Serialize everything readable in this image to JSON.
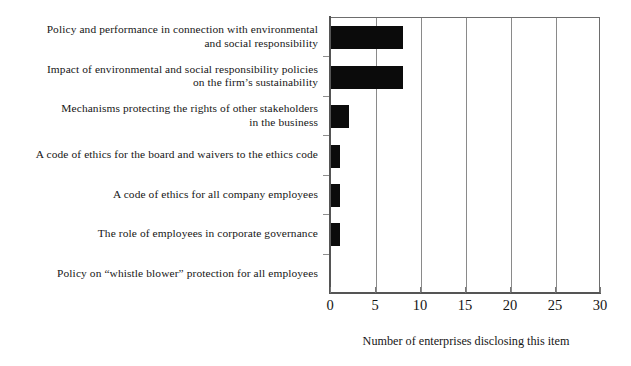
{
  "chart_data": {
    "type": "bar",
    "orientation": "horizontal",
    "title": "",
    "xlabel": "Number of enterprises disclosing this item",
    "ylabel": "",
    "xlim": [
      0,
      30
    ],
    "xticks": [
      0,
      5,
      10,
      15,
      20,
      25,
      30
    ],
    "grid": "vertical",
    "legend": "none",
    "bar_color": "#0b0b0b",
    "categories": [
      "Policy and performance in connection with environmental and social responsibility",
      "Impact of environmental and social responsibility policies on the firm’s sustainability",
      "Mechanisms protecting the rights of other stakeholders in the business",
      "A code of ethics for the board and waivers to the ethics code",
      "A code of ethics for all company employees",
      "The role of employees in corporate governance",
      "Policy on “whistle blower” protection for all employees"
    ],
    "category_lines": [
      [
        "Policy and performance in connection with environmental",
        "and social responsibility"
      ],
      [
        "Impact of environmental and social responsibility policies",
        "on the firm’s sustainability"
      ],
      [
        "Mechanisms protecting the rights of other stakeholders",
        "in the business"
      ],
      [
        "A code of ethics for the board and waivers to the ethics code"
      ],
      [
        "A code of ethics for all company employees"
      ],
      [
        "The role of employees in corporate governance"
      ],
      [
        "Policy on “whistle blower” protection for all employees"
      ]
    ],
    "values": [
      8,
      8,
      2,
      1,
      1,
      1,
      0
    ]
  },
  "axis": {
    "x_tick_labels": [
      "0",
      "5",
      "10",
      "15",
      "20",
      "25",
      "30"
    ],
    "x_title": "Number of enterprises disclosing this item"
  }
}
